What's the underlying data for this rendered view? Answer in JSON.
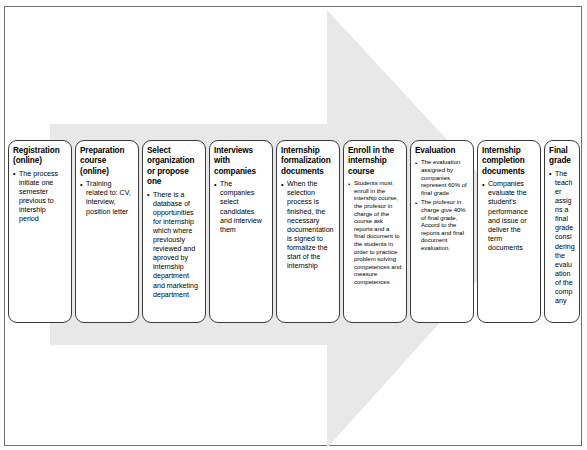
{
  "diagram": {
    "arrow": {
      "name": "process-arrow",
      "direction": "right",
      "fill_color": "#e8e8e8"
    },
    "frame_color": "#6f6f6f",
    "box_border_color": "#3a3a3a",
    "box_fill_color": "#ffffff",
    "steps": [
      {
        "title": "Registration (online)",
        "bullets": [
          "The process initiate one semester previous to intership period"
        ]
      },
      {
        "title": "Preparation course (online)",
        "bullets": [
          "Training related to: CV, interview, position letter"
        ]
      },
      {
        "title": "Select organization or propose one",
        "bullets": [
          "There is a database of opportunities for internship which where previously reviewed and aproved by internship department and marketing department"
        ]
      },
      {
        "title": "Interviews with companies",
        "bullets": [
          "The companies select candidates and interview them"
        ]
      },
      {
        "title": "Internship formalization documents",
        "bullets": [
          "When the selection process is finished, the necessary documentation is signed to formalize the start of the internship"
        ]
      },
      {
        "title": "Enroll in the internship course",
        "bullets": [
          "Students must enroll in the intership course, the profesor in charge of the course ask reports and a final document to the students in order to practice problem solving competences and measure competences"
        ]
      },
      {
        "title": "Evaluation",
        "bullets": [
          "The evaluation assigned by companies represent 60% of final grade",
          "The profesor in charge give 40% of final grade, Accord to the reports and final document evaluation."
        ]
      },
      {
        "title": "Internship completion documents",
        "bullets": [
          "Companies evaluate the student's performance and issue or deliver the term documents"
        ]
      },
      {
        "title": "Final grade",
        "bullets": [
          "The teacher assigns a final grade considering the evaluation of the company"
        ]
      }
    ]
  }
}
